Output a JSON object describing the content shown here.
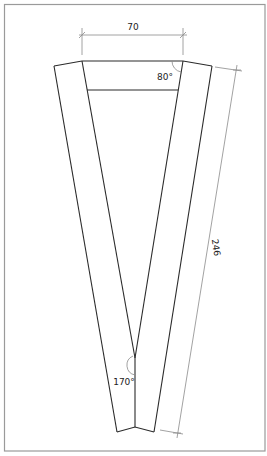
{
  "drawing": {
    "frame": {
      "x": 4,
      "y": 4,
      "width": 261,
      "height": 447,
      "color": "#9a9a9a"
    },
    "line_color": "#2a2a2a",
    "dim_color": "#8a8a8a",
    "shape": {
      "outer_top_left": [
        54,
        66
      ],
      "inner_top_left": [
        82,
        61
      ],
      "inner_top_right": [
        183,
        61
      ],
      "outer_top_right": [
        212,
        66
      ],
      "crossbar_y": 90,
      "inner_v_apex": [
        135,
        358
      ],
      "bottom_left": [
        117,
        432
      ],
      "bottom_apex": [
        135,
        427
      ],
      "bottom_right": [
        154,
        432
      ]
    },
    "dimensions": {
      "top_width": {
        "value": "70",
        "unit": "mm"
      },
      "side_length": {
        "value": "246",
        "unit": "mm"
      }
    },
    "angles": {
      "top_corner": "80°",
      "bottom_apex": "170°"
    }
  }
}
